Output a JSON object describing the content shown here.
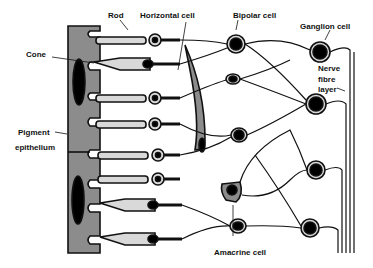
{
  "labels": {
    "rod": "Rod",
    "horizontal_cell": "Horizontal cell",
    "bipolar_cell": "Bipolar cell",
    "ganglion_cell": "Ganglion cell",
    "cone": "Cone",
    "nerve_fibre_layer_1": "Nerve",
    "nerve_fibre_layer_2": "fibre",
    "nerve_fibre_layer_3": "layer",
    "pigment_epithelium_1": "Pigment",
    "pigment_epithelium_2": "epithelium",
    "amacrine_cell": "Amacrine cell"
  },
  "colors": {
    "outline": "#111111",
    "cell_fill": "#d9d9d9",
    "epithelium_fill": "#8c8c8c",
    "nucleus": "#000000",
    "background": "#ffffff"
  }
}
